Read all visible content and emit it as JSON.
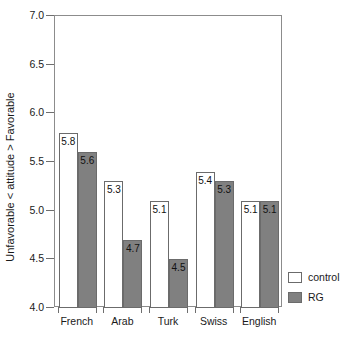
{
  "chart_data": {
    "type": "bar",
    "title": "",
    "subtitle": "",
    "xlabel": "",
    "ylabel": "Unfavorable < attitude > Favorable",
    "categories": [
      "French",
      "Arab",
      "Turk",
      "Swiss",
      "English"
    ],
    "series": [
      {
        "name": "control",
        "color": "#ffffff",
        "values": [
          5.8,
          5.3,
          5.1,
          5.4,
          5.1
        ]
      },
      {
        "name": "RG",
        "color": "#808080",
        "values": [
          5.6,
          4.7,
          4.5,
          5.3,
          5.1
        ]
      }
    ],
    "value_labels": {
      "control": [
        "5.8",
        "5.3",
        "5.1",
        "5.4",
        "5.1"
      ],
      "RG": [
        "5.6",
        "4.7",
        "4.5",
        "5.3",
        "5.1"
      ]
    },
    "ylim": [
      4.0,
      7.0
    ],
    "ytick_values": [
      7.0,
      6.5,
      6.0,
      5.5,
      5.0,
      4.5,
      4.0
    ],
    "ytick_labels": [
      "7.0",
      "6.5",
      "6.0",
      "5.5",
      "5.0",
      "4.5",
      "4.0"
    ],
    "grid": false,
    "legend_position": "right-bottom-outside",
    "legend_entries": [
      "control",
      "RG"
    ]
  },
  "axes": {
    "y": {
      "label": "Unfavorable < attitude > Favorable",
      "ticks": [
        {
          "label": "7.0",
          "value": 7.0
        },
        {
          "label": "6.5",
          "value": 6.5
        },
        {
          "label": "6.0",
          "value": 6.0
        },
        {
          "label": "5.5",
          "value": 5.5
        },
        {
          "label": "5.0",
          "value": 5.0
        },
        {
          "label": "4.5",
          "value": 4.5
        },
        {
          "label": "4.0",
          "value": 4.0
        }
      ]
    },
    "x": {
      "label": "",
      "ticks": [
        {
          "label": "French"
        },
        {
          "label": "Arab"
        },
        {
          "label": "Turk"
        },
        {
          "label": "Swiss"
        },
        {
          "label": "English"
        }
      ]
    }
  },
  "legend": {
    "items": [
      {
        "label": "control",
        "color": "#ffffff"
      },
      {
        "label": "RG",
        "color": "#808080"
      }
    ]
  }
}
